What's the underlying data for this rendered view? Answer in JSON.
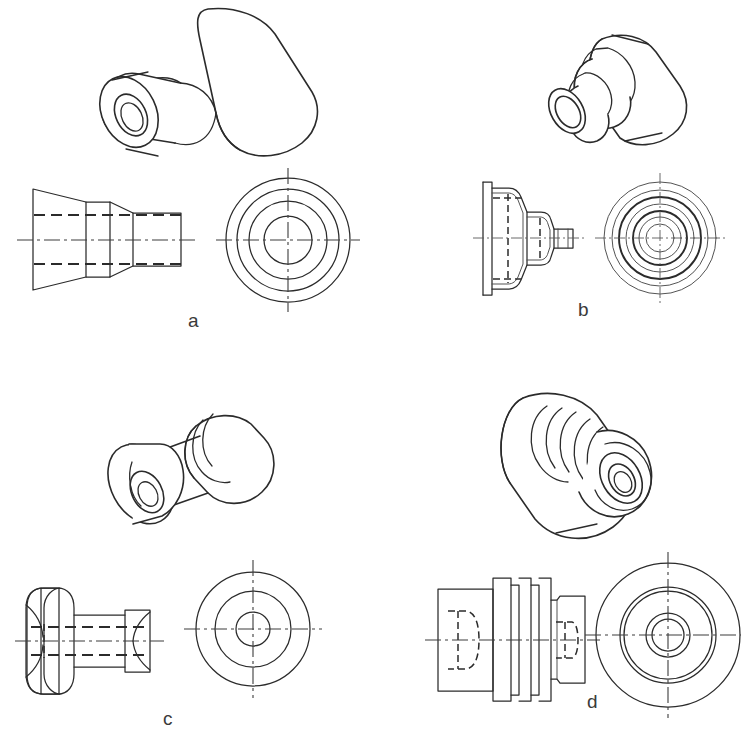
{
  "page": {
    "kind": "engineering-drawing-worksheet",
    "background_color": "#ffffff",
    "line_color": "#2b2b2b",
    "label_color": "#3a3a3a",
    "width": 741,
    "height": 742
  },
  "figures": [
    {
      "id": "a",
      "label": "a",
      "label_x": 188,
      "label_y": 310,
      "description": "Stepped conical bushing with through hole",
      "views": [
        {
          "name": "pictorial-isometric",
          "type": "isometric"
        },
        {
          "name": "front-view",
          "type": "orthographic-side",
          "hidden_lines": 2,
          "centerlines": 1
        },
        {
          "name": "end-view",
          "type": "orthographic-circular",
          "circle_count": 4
        }
      ],
      "circle_radii": [
        62,
        51,
        39,
        24
      ]
    },
    {
      "id": "b",
      "label": "b",
      "label_x": 578,
      "label_y": 299,
      "description": "Thin-walled stepped conical cap with small boss",
      "views": [
        {
          "name": "pictorial-isometric",
          "type": "isometric"
        },
        {
          "name": "front-view",
          "type": "orthographic-side",
          "hidden_lines": 4,
          "centerlines": 1
        },
        {
          "name": "end-view",
          "type": "orthographic-circular",
          "circle_count": 7
        }
      ],
      "circle_radii": [
        56,
        48,
        41,
        34,
        27,
        21,
        14
      ]
    },
    {
      "id": "c",
      "label": "c",
      "label_x": 163,
      "label_y": 708,
      "description": "Double flanged spool / pulley with central bore",
      "views": [
        {
          "name": "pictorial-isometric",
          "type": "isometric"
        },
        {
          "name": "front-view",
          "type": "orthographic-side",
          "hidden_lines": 2,
          "centerlines": 1
        },
        {
          "name": "end-view",
          "type": "orthographic-circular",
          "circle_count": 3
        }
      ],
      "circle_radii": [
        57,
        38,
        17
      ]
    },
    {
      "id": "d",
      "label": "d",
      "label_x": 587,
      "label_y": 691,
      "description": "Grooved cylindrical spool with counterbored end",
      "views": [
        {
          "name": "pictorial-isometric",
          "type": "isometric"
        },
        {
          "name": "front-view",
          "type": "orthographic-side",
          "hidden_lines": 2,
          "centerlines": 1
        },
        {
          "name": "end-view",
          "type": "orthographic-circular",
          "circle_count": 5
        }
      ],
      "circle_radii": [
        72,
        48,
        44,
        22,
        16
      ]
    }
  ]
}
